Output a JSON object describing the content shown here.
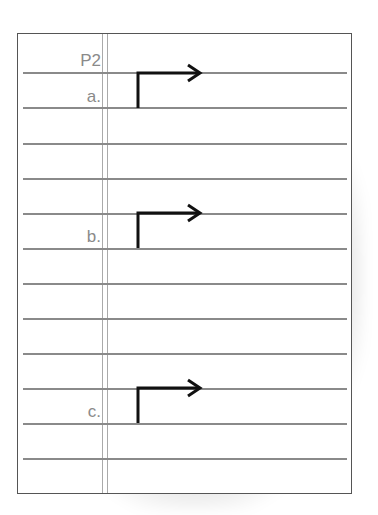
{
  "page_label": "P2",
  "items": [
    {
      "label": "a.",
      "arrow_icon": "right-angle-arrow-icon"
    },
    {
      "label": "b.",
      "arrow_icon": "right-angle-arrow-icon"
    },
    {
      "label": "c.",
      "arrow_icon": "right-angle-arrow-icon"
    }
  ],
  "colors": {
    "rule_line": "#8a8a8a",
    "margin_line": "#aaaaaa",
    "label_text": "#8a8a8a",
    "arrow": "#111111"
  }
}
